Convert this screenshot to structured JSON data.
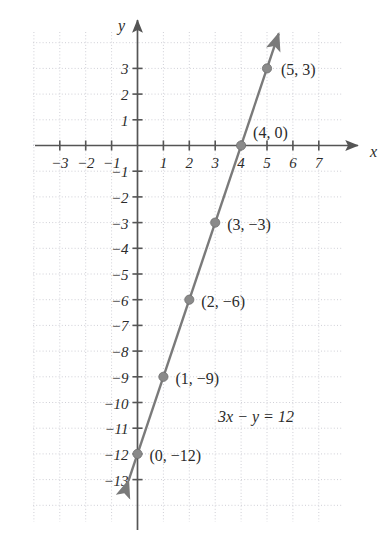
{
  "figure": {
    "background_color": "#ffffff",
    "grid_color": "#cfcfd6",
    "axis_color": "#555555",
    "line_color": "#7a7a7a",
    "point_color": "#8a8a8a",
    "text_color": "#2b2b2b",
    "x_axis_name": "x",
    "y_axis_name": "y",
    "equation": "3x − y = 12"
  },
  "chart_data": {
    "type": "line",
    "title": "",
    "subtitle": "",
    "xlabel": "x",
    "ylabel": "y",
    "xlim": [
      -3.8,
      8.0
    ],
    "ylim": [
      -13.8,
      3.9
    ],
    "grid": true,
    "grid_style": "dotted",
    "legend": "none",
    "equation": "3x − y = 12",
    "slope": 3,
    "y_intercept": -12,
    "x_intercept": 4,
    "x_ticks": [
      -3,
      -2,
      -1,
      1,
      2,
      3,
      4,
      5,
      6,
      7
    ],
    "x_tick_labels": [
      "−3",
      "−2",
      "−1",
      "1",
      "2",
      "3",
      "4",
      "5",
      "6",
      "7"
    ],
    "y_ticks": [
      3,
      2,
      1,
      -1,
      -2,
      -3,
      -4,
      -5,
      -6,
      -7,
      -8,
      -9,
      -10,
      -11,
      -12,
      -13
    ],
    "y_tick_labels": [
      "3",
      "2",
      "1",
      "−1",
      "−2",
      "−3",
      "−4",
      "−5",
      "−6",
      "−7",
      "−8",
      "−9",
      "−10",
      "−11",
      "−12",
      "−13"
    ],
    "series": [
      {
        "name": "3x - y = 12",
        "x": [
          -0.35,
          5.45
        ],
        "y": [
          -13.05,
          4.35
        ],
        "arrows": "both"
      }
    ],
    "points": [
      {
        "x": 5,
        "y": 3,
        "label": "(5, 3)",
        "label_dx": 14,
        "label_dy": 7
      },
      {
        "x": 4,
        "y": 0,
        "label": "(4, 0)",
        "label_dx": 12,
        "label_dy": -8
      },
      {
        "x": 3,
        "y": -3,
        "label": "(3, −3)",
        "label_dx": 12,
        "label_dy": 7
      },
      {
        "x": 2,
        "y": -6,
        "label": "(2, −6)",
        "label_dx": 12,
        "label_dy": 7
      },
      {
        "x": 1,
        "y": -9,
        "label": "(1, −9)",
        "label_dx": 12,
        "label_dy": 7
      },
      {
        "x": 0,
        "y": -12,
        "label": "(0, −12)",
        "label_dx": 12,
        "label_dy": 7
      }
    ],
    "annotations": [
      {
        "text": "3x − y = 12",
        "x": 5.0,
        "y": -10.6
      }
    ]
  }
}
